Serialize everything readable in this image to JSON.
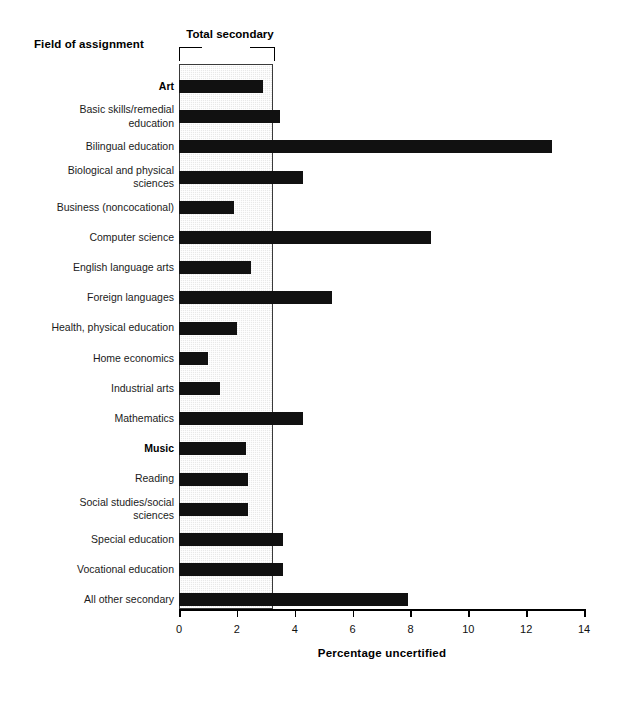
{
  "header": {
    "field_title": "Field of assignment",
    "band_label": "Total secondary"
  },
  "axis": {
    "x_title": "Percentage uncertified",
    "ticks": [
      "0",
      "2",
      "4",
      "6",
      "8",
      "10",
      "12",
      "14"
    ]
  },
  "chart_data": {
    "type": "bar",
    "orientation": "horizontal",
    "title": "",
    "xlabel": "Percentage uncertified",
    "ylabel": "Field of assignment",
    "xlim": [
      0,
      14
    ],
    "xticks": [
      0,
      2,
      4,
      6,
      8,
      10,
      12,
      14
    ],
    "grid": false,
    "legend": null,
    "reference_band": {
      "label": "Total secondary",
      "value": 3.25,
      "from": 0,
      "to": 3.25,
      "color": "#e9e9e9"
    },
    "bar_color": "#111111",
    "categories": [
      "Art",
      "Basic skills/remedial education",
      "Bilingual education",
      "Biological and physical sciences",
      "Business (noncocational)",
      "Computer science",
      "English language arts",
      "Foreign languages",
      "Health, physical education",
      "Home economics",
      "Industrial arts",
      "Mathematics",
      "Music",
      "Reading",
      "Social studies/social sciences",
      "Special education",
      "Vocational education",
      "All other secondary"
    ],
    "category_display": [
      "Art",
      "Basic skills/remedial\neducation",
      "Bilingual education",
      "Biological and physical\nsciences",
      "Business (noncocational)",
      "Computer science",
      "English language arts",
      "Foreign languages",
      "Health, physical education",
      "Home economics",
      "Industrial arts",
      "Mathematics",
      "Music",
      "Reading",
      "Social studies/social\nsciences",
      "Special education",
      "Vocational education",
      "All other secondary"
    ],
    "category_bold": [
      true,
      false,
      false,
      false,
      false,
      false,
      false,
      false,
      false,
      false,
      false,
      false,
      true,
      false,
      false,
      false,
      false,
      false
    ],
    "values": [
      2.9,
      3.5,
      12.9,
      4.3,
      1.9,
      8.7,
      2.5,
      5.3,
      2.0,
      1.0,
      1.4,
      4.3,
      2.3,
      2.4,
      2.4,
      3.6,
      3.6,
      7.9
    ]
  }
}
